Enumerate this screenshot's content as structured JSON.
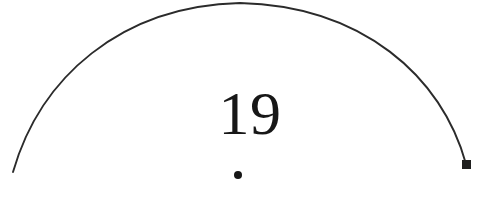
{
  "page": {
    "width": 504,
    "height": 208,
    "background_color": "#ffffff",
    "ink_color": "#2b2b2b",
    "text_color": "#171717"
  },
  "folio": {
    "number": "19",
    "aria_label": "page number 19"
  },
  "ornaments": {
    "dot": {
      "name": "dot-below-number",
      "shape": "filled-circle",
      "center_x": 238,
      "center_y": 175,
      "diameter": 8,
      "color": "#171717"
    },
    "arc": {
      "name": "drawn-arc",
      "shape": "open-arc",
      "stroke_color": "#2b2b2b",
      "stroke_width": 1.9,
      "start_point": [
        13,
        172
      ],
      "apex_point": [
        240,
        3
      ],
      "end_point": [
        466,
        164
      ],
      "path": "M 13 172 C 40 78, 120 6, 240 3 C 362 6, 442 76, 466 164"
    },
    "end_marker": {
      "name": "arc-end-square-marker",
      "shape": "filled-square",
      "x": 462,
      "y": 160,
      "size": 9,
      "color": "#20201f"
    }
  }
}
